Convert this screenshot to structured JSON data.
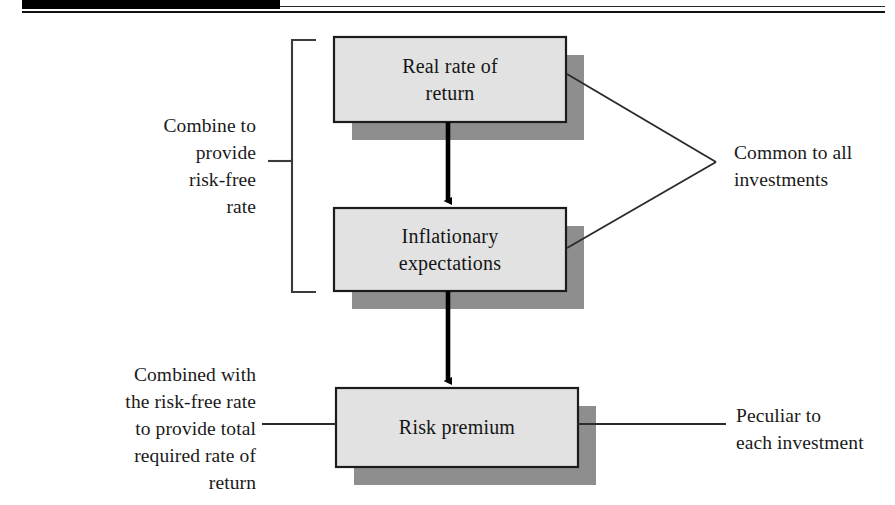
{
  "page": {
    "width": 895,
    "height": 505,
    "background": "#ffffff"
  },
  "colors": {
    "box_fill": "#e2e2e2",
    "box_border": "#1c1c1c",
    "box_shadow": "#8e8e8e",
    "line": "#1a1a1a",
    "arrow": "#000000",
    "text": "#151515",
    "masthead": "#000000"
  },
  "masthead": {
    "black_bar": "",
    "rule": ""
  },
  "diagram": {
    "type": "block-flow",
    "boxes": [
      {
        "id": "real-rate-of-return",
        "label": "Real rate of\nreturn",
        "line1": "Real rate of",
        "line2": "return",
        "x": 334,
        "y": 37,
        "w": 232,
        "h": 85
      },
      {
        "id": "inflationary-expectations",
        "label": "Inflationary\nexpectations",
        "line1": "Inflationary",
        "line2": "expectations",
        "x": 334,
        "y": 208,
        "w": 232,
        "h": 83
      },
      {
        "id": "risk-premium",
        "label": "Risk premium",
        "line1": "Risk premium",
        "line2": "",
        "x": 336,
        "y": 388,
        "w": 242,
        "h": 79
      }
    ],
    "arrows": [
      {
        "id": "arrow-real-to-inflation",
        "from": "real-rate-of-return",
        "to": "inflationary-expectations"
      },
      {
        "id": "arrow-inflation-to-risk",
        "from": "inflationary-expectations",
        "to": "risk-premium"
      }
    ],
    "annotations": [
      {
        "id": "combine-risk-free",
        "text": "Combine to\nprovide\nrisk-free\nrate",
        "align": "right",
        "position": "left-upper"
      },
      {
        "id": "combined-total-required",
        "text": "Combined with\nthe risk-free rate\nto provide total\nrequired rate of\nreturn",
        "align": "right",
        "position": "left-lower"
      },
      {
        "id": "common-to-all",
        "text": "Common to all\ninvestments",
        "align": "left",
        "position": "right-upper"
      },
      {
        "id": "peculiar-to-each",
        "text": "Peculiar to\neach investment",
        "align": "left",
        "position": "right-lower"
      }
    ]
  }
}
